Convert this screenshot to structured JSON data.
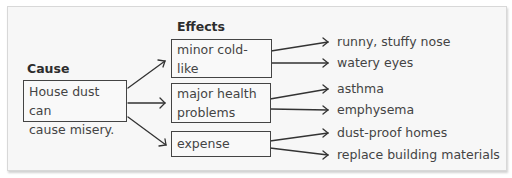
{
  "diagram": {
    "cause": {
      "heading": "Cause",
      "text_line1": "House dust can",
      "text_line2": "cause misery."
    },
    "effects_heading": "Effects",
    "effects": [
      {
        "label_line1": "minor cold-like",
        "label_line2": "symptoms",
        "details": [
          "runny, stuffy nose",
          "watery eyes"
        ]
      },
      {
        "label_line1": "major health",
        "label_line2": "problems",
        "details": [
          "asthma",
          "emphysema"
        ]
      },
      {
        "label_line1": "expense",
        "label_line2": "",
        "details": [
          "dust-proof homes",
          "replace building materials"
        ]
      }
    ]
  }
}
